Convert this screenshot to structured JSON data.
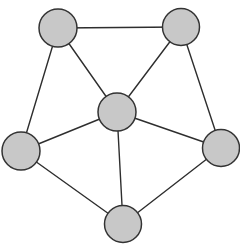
{
  "diagram": {
    "type": "undirected-graph",
    "style": {
      "node_fill": "#c8c8c8",
      "node_stroke": "#333333",
      "edge_stroke": "#2e2e2e",
      "background": "#ffffff"
    },
    "nodes": [
      {
        "id": "top-left",
        "x": 58,
        "y": 28,
        "r": 19
      },
      {
        "id": "top-right",
        "x": 181,
        "y": 27,
        "r": 18.5
      },
      {
        "id": "center",
        "x": 117,
        "y": 112,
        "r": 19
      },
      {
        "id": "left",
        "x": 21,
        "y": 151,
        "r": 19
      },
      {
        "id": "right",
        "x": 221,
        "y": 148,
        "r": 18.5
      },
      {
        "id": "bottom",
        "x": 123,
        "y": 224,
        "r": 18.5
      }
    ],
    "edges": [
      {
        "from": "top-left",
        "to": "top-right"
      },
      {
        "from": "top-left",
        "to": "center"
      },
      {
        "from": "top-right",
        "to": "center"
      },
      {
        "from": "top-left",
        "to": "left"
      },
      {
        "from": "top-right",
        "to": "right"
      },
      {
        "from": "center",
        "to": "left"
      },
      {
        "from": "center",
        "to": "right"
      },
      {
        "from": "center",
        "to": "bottom"
      },
      {
        "from": "left",
        "to": "bottom"
      },
      {
        "from": "right",
        "to": "bottom"
      }
    ]
  }
}
